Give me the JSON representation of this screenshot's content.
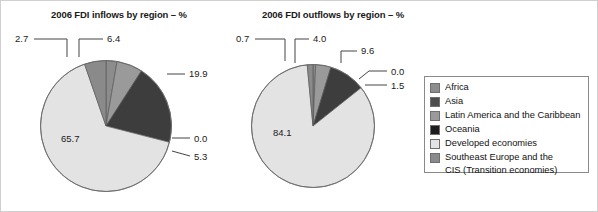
{
  "figure": {
    "background": "#ffffff",
    "border_color": "#cfcfcf"
  },
  "legend": {
    "title": "",
    "position": "right",
    "border_color": "#8a8a8a",
    "items": [
      {
        "label": "Africa",
        "color": "#8c8c8c"
      },
      {
        "label": "Asia",
        "color": "#4d4d4d"
      },
      {
        "label": "Latin America and the Caribbean",
        "color": "#9a9a9a"
      },
      {
        "label": "Oceania",
        "color": "#1c1c1c"
      },
      {
        "label": "Developed economies",
        "color": "#e3e3e3"
      },
      {
        "label": "Southeast Europe and the\nCIS (Transition economies)",
        "color": "#8a8a8a"
      }
    ]
  },
  "chart_data": [
    {
      "type": "pie",
      "title": "2006 FDI inflows by region – %",
      "xlabel": "",
      "ylabel": "",
      "categories": [
        "Africa",
        "Asia",
        "Latin America and the Caribbean",
        "Oceania",
        "Developed economies",
        "Southeast Europe and the CIS (Transition economies)"
      ],
      "values": [
        2.7,
        6.4,
        19.9,
        0.0,
        65.7,
        5.3
      ],
      "colors": [
        "#8c8c8c",
        "#9a9a9a",
        "#3d3d3d",
        "#1c1c1c",
        "#e3e3e3",
        "#8a8a8a"
      ],
      "labels": [
        "2.7",
        "6.4",
        "19.9",
        "0.0",
        "65.7",
        "5.3"
      ],
      "start_angle_deg": 0,
      "direction": "clockwise",
      "total": 100.0
    },
    {
      "type": "pie",
      "title": "2006 FDI outflows by region – %",
      "xlabel": "",
      "ylabel": "",
      "categories": [
        "Africa",
        "Asia",
        "Latin America and the Caribbean",
        "Oceania",
        "Developed economies",
        "Southeast Europe and the CIS (Transition economies)"
      ],
      "values": [
        0.7,
        4.0,
        9.6,
        0.0,
        84.1,
        1.5
      ],
      "colors": [
        "#8c8c8c",
        "#9a9a9a",
        "#3d3d3d",
        "#1c1c1c",
        "#e3e3e3",
        "#8a8a8a"
      ],
      "labels": [
        "0.7",
        "4.0",
        "9.6",
        "0.0",
        "84.1",
        "1.5"
      ],
      "start_angle_deg": 0,
      "direction": "clockwise",
      "total": 99.9
    }
  ]
}
